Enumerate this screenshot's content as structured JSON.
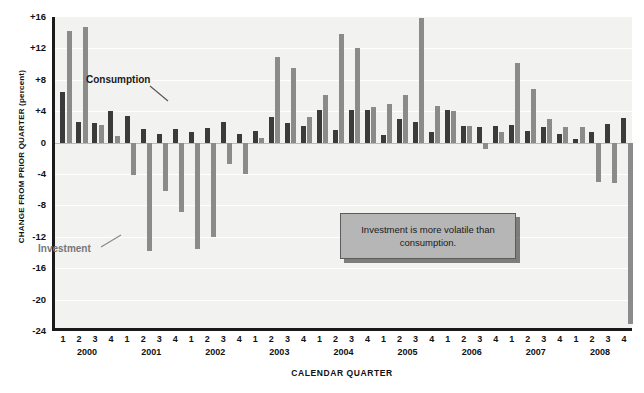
{
  "axes": {
    "y_title": "CHANGE FROM PRIOR QUARTER (percent)",
    "x_title": "CALENDAR QUARTER",
    "y_ticks": [
      "+16",
      "+12",
      "+8",
      "+4",
      "0",
      "-4",
      "-8",
      "-12",
      "-16",
      "-20",
      "-24"
    ],
    "quarters": [
      "1",
      "2",
      "3",
      "4"
    ],
    "years": [
      "2000",
      "2001",
      "2002",
      "2003",
      "2004",
      "2005",
      "2006",
      "2007",
      "2008"
    ]
  },
  "series_labels": {
    "consumption": "Consumption",
    "investment": "Investment"
  },
  "annotation": {
    "text": "Investment is more volatile than consumption."
  },
  "colors": {
    "consumption": "#3b3b3b",
    "investment": "#8b8b8b",
    "plot_background": "#f2f2f0",
    "axis": "#1a1a1a",
    "annotation_fill": "#b6b6b6"
  },
  "chart_data": {
    "type": "bar",
    "title": "",
    "xlabel": "CALENDAR QUARTER",
    "ylabel": "CHANGE FROM PRIOR QUARTER (percent)",
    "ylim": [
      -24,
      16
    ],
    "ytick_step": 4,
    "grid": true,
    "legend": "inline-labels",
    "categories": [
      "2000 Q1",
      "2000 Q2",
      "2000 Q3",
      "2000 Q4",
      "2001 Q1",
      "2001 Q2",
      "2001 Q3",
      "2001 Q4",
      "2002 Q1",
      "2002 Q2",
      "2002 Q3",
      "2002 Q4",
      "2003 Q1",
      "2003 Q2",
      "2003 Q3",
      "2003 Q4",
      "2004 Q1",
      "2004 Q2",
      "2004 Q3",
      "2004 Q4",
      "2005 Q1",
      "2005 Q2",
      "2005 Q3",
      "2005 Q4",
      "2006 Q1",
      "2006 Q2",
      "2006 Q3",
      "2006 Q4",
      "2007 Q1",
      "2007 Q2",
      "2007 Q3",
      "2007 Q4",
      "2008 Q1",
      "2008 Q2",
      "2008 Q3",
      "2008 Q4"
    ],
    "series": [
      {
        "name": "Consumption",
        "color": "#3b3b3b",
        "values": [
          6.5,
          2.6,
          2.5,
          4.0,
          3.4,
          1.7,
          1.1,
          1.7,
          1.3,
          1.8,
          2.6,
          1.1,
          1.5,
          3.2,
          2.5,
          2.1,
          4.2,
          1.6,
          4.1,
          4.2,
          1.0,
          3.0,
          2.6,
          1.3,
          4.2,
          2.1,
          2.0,
          2.1,
          2.3,
          1.5,
          2.0,
          1.1,
          0.4,
          1.3,
          2.4,
          3.1
        ]
      },
      {
        "name": "Investment",
        "color": "#8b8b8b",
        "values": [
          14.2,
          14.7,
          2.2,
          0.8,
          -4.1,
          -13.8,
          -6.2,
          -8.9,
          -13.6,
          -12.0,
          -2.7,
          -4.0,
          0.6,
          10.9,
          9.5,
          3.2,
          6.1,
          13.8,
          12.0,
          4.5,
          4.9,
          6.1,
          15.9,
          4.7,
          4.0,
          2.1,
          -0.8,
          1.4,
          10.1,
          6.8,
          3.0,
          2.0,
          2.0,
          -5.0,
          -5.1,
          -23.1
        ]
      }
    ],
    "annotations": [
      {
        "text": "Investment is more volatile than consumption."
      },
      {
        "text": "Consumption",
        "target": "consumption-series"
      },
      {
        "text": "Investment",
        "target": "investment-series"
      }
    ]
  }
}
